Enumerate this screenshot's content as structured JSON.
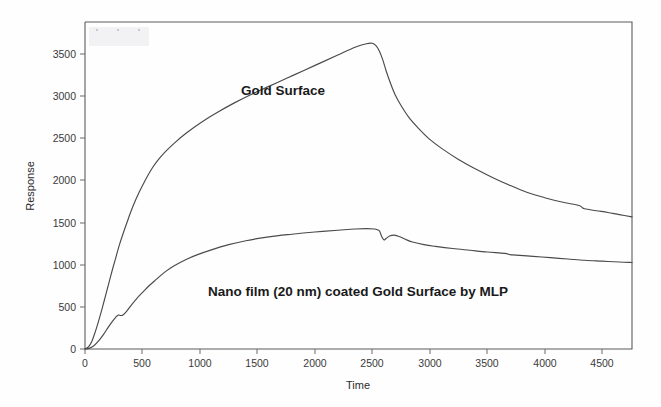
{
  "figure": {
    "background_color": "#fefefe",
    "line_color": "#4a4a4a",
    "text_color": "#1a1a1a"
  },
  "axes": {
    "x_title": "Time",
    "y_title": "Response",
    "x_ticks": [
      "0",
      "500",
      "1000",
      "1500",
      "2000",
      "2500",
      "3000",
      "3500",
      "4000",
      "4500"
    ],
    "y_ticks": [
      "0",
      "500",
      "1000",
      "1500",
      "2000",
      "2500",
      "3000",
      "3500"
    ]
  },
  "annotations": {
    "gold_surface_label": "Gold Surface",
    "nano_film_label": "Nano film (20 nm) coated Gold Surface by MLP"
  },
  "chart_data": {
    "type": "line",
    "title": "",
    "xlabel": "Time",
    "ylabel": "Response",
    "xlim": [
      0,
      4760
    ],
    "ylim": [
      0,
      3760
    ],
    "xticks": [
      0,
      500,
      1000,
      1500,
      2000,
      2500,
      3000,
      3500,
      4000,
      4500
    ],
    "yticks": [
      0,
      500,
      1000,
      1500,
      2000,
      2500,
      3000,
      3500
    ],
    "grid": false,
    "legend": "inline-annotations",
    "series": [
      {
        "name": "Gold Surface",
        "color": "#4a4a4a",
        "label_position": {
          "x": 1500,
          "y": 3000
        },
        "x": [
          0,
          30,
          60,
          90,
          120,
          150,
          180,
          210,
          240,
          270,
          300,
          340,
          380,
          420,
          470,
          520,
          580,
          640,
          700,
          780,
          860,
          950,
          1050,
          1150,
          1300,
          1450,
          1600,
          1750,
          1900,
          2050,
          2200,
          2350,
          2450,
          2500,
          2530,
          2560,
          2590,
          2620,
          2660,
          2700,
          2750,
          2820,
          2900,
          3000,
          3100,
          3250,
          3400,
          3550,
          3700,
          3850,
          4000,
          4150,
          4300,
          4330,
          4360,
          4450,
          4550,
          4650,
          4760
        ],
        "y": [
          0,
          25,
          90,
          200,
          330,
          470,
          620,
          770,
          920,
          1060,
          1200,
          1360,
          1510,
          1650,
          1800,
          1930,
          2070,
          2180,
          2270,
          2370,
          2460,
          2550,
          2640,
          2720,
          2830,
          2930,
          3020,
          3110,
          3200,
          3290,
          3380,
          3470,
          3510,
          3515,
          3490,
          3430,
          3330,
          3200,
          3050,
          2920,
          2800,
          2660,
          2540,
          2410,
          2310,
          2180,
          2070,
          1970,
          1880,
          1800,
          1740,
          1690,
          1650,
          1620,
          1610,
          1590,
          1570,
          1545,
          1520
        ]
      },
      {
        "name": "Nano film (20 nm) coated Gold Surface by MLP",
        "color": "#4a4a4a",
        "label_position": {
          "x": 2050,
          "y": 700
        },
        "x": [
          0,
          40,
          80,
          120,
          160,
          200,
          240,
          270,
          290,
          310,
          330,
          360,
          400,
          450,
          500,
          560,
          620,
          700,
          780,
          880,
          980,
          1100,
          1250,
          1400,
          1600,
          1800,
          2000,
          2200,
          2350,
          2450,
          2520,
          2560,
          2580,
          2600,
          2620,
          2650,
          2690,
          2720,
          2760,
          2800,
          2850,
          2950,
          3050,
          3200,
          3350,
          3500,
          3650,
          3700,
          3750,
          3900,
          4050,
          4200,
          4350,
          4500,
          4650,
          4760
        ],
        "y": [
          0,
          10,
          40,
          95,
          165,
          245,
          320,
          370,
          390,
          385,
          390,
          430,
          500,
          580,
          650,
          730,
          800,
          890,
          960,
          1030,
          1085,
          1140,
          1200,
          1245,
          1290,
          1320,
          1345,
          1365,
          1380,
          1385,
          1380,
          1360,
          1300,
          1255,
          1270,
          1300,
          1310,
          1300,
          1280,
          1255,
          1230,
          1200,
          1180,
          1155,
          1135,
          1115,
          1100,
          1085,
          1080,
          1065,
          1050,
          1035,
          1020,
          1010,
          1000,
          995
        ]
      }
    ]
  }
}
